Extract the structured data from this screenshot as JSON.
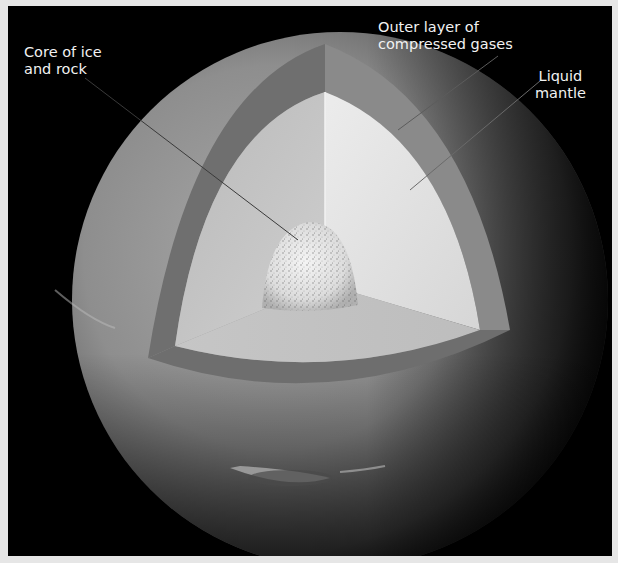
{
  "figure": {
    "title": "",
    "background_color": "#000000",
    "border_color": "#e6e6e6"
  },
  "labels": {
    "core": {
      "line1": "Core of ice",
      "line2": "and rock"
    },
    "outer_layer": {
      "line1": "Outer layer of",
      "line2": "compressed gases"
    },
    "mantle": {
      "line1": "Liquid",
      "line2": "mantle"
    }
  },
  "layers": [
    {
      "name": "Outer layer of compressed gases",
      "color": "#7a7a7a"
    },
    {
      "name": "Liquid mantle",
      "color": "#d8d8d8"
    },
    {
      "name": "Core of ice and rock",
      "color": "#e9e9e9"
    }
  ]
}
